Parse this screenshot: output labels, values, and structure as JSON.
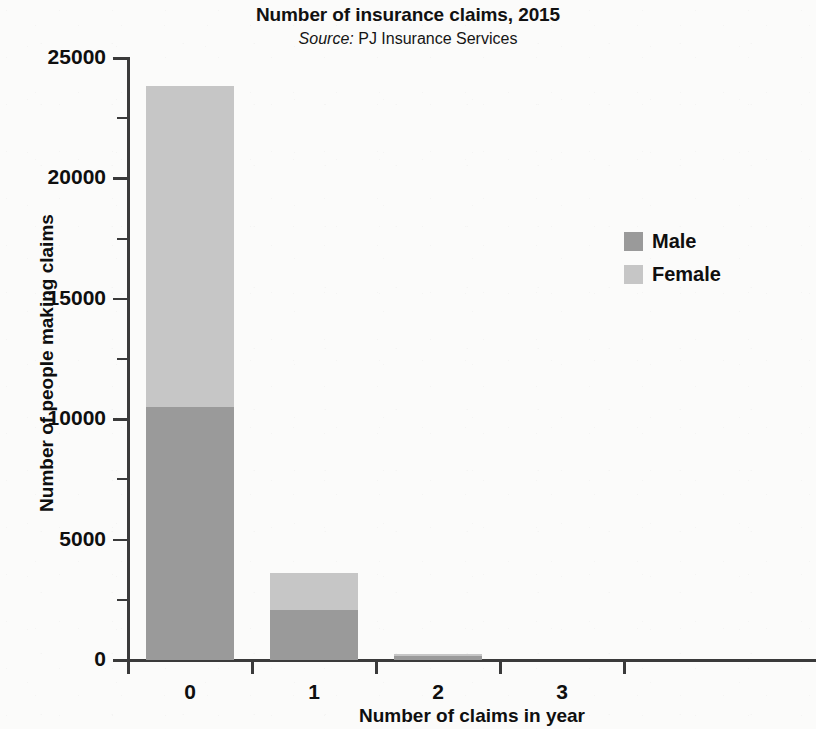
{
  "chart_data": {
    "type": "bar",
    "subtype": "stacked-vertical",
    "title": "Number of insurance claims, 2015",
    "subtitle_prefix": "Source:",
    "subtitle_text": "PJ Insurance Services",
    "xlabel": "Number of claims in year",
    "ylabel": "Number of people making claims",
    "categories": [
      "0",
      "1",
      "2",
      "3"
    ],
    "series": [
      {
        "name": "Male",
        "color": "#9a9a9a",
        "values": [
          10500,
          2080,
          150,
          0
        ]
      },
      {
        "name": "Female",
        "color": "#c6c6c6",
        "values": [
          13340,
          1530,
          100,
          0
        ]
      }
    ],
    "totals": [
      23840,
      3610,
      250,
      0
    ],
    "ylim": [
      0,
      25000
    ],
    "y_ticks": [
      "0",
      "5000",
      "10000",
      "15000",
      "20000",
      "25000"
    ],
    "y_tick_values": [
      0,
      5000,
      10000,
      15000,
      20000,
      25000
    ],
    "y_minor_tick_values": [
      2500,
      7500,
      12500,
      17500,
      22500
    ],
    "grid": false,
    "legend_position": "right",
    "stacked": true
  },
  "legend": {
    "items": [
      {
        "label": "Male",
        "color": "#9a9a9a"
      },
      {
        "label": "Female",
        "color": "#c6c6c6"
      }
    ]
  }
}
